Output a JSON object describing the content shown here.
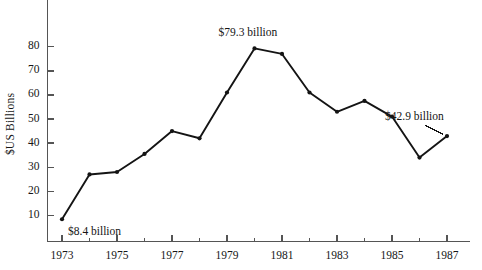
{
  "chart_data": {
    "type": "line",
    "title": "",
    "subtitle": "",
    "xlabel": "",
    "ylabel": "$US Billions",
    "xlim": [
      1972.6,
      1987.6
    ],
    "ylim": [
      0,
      86
    ],
    "grid": false,
    "legend": false,
    "legend_position": "none",
    "x": [
      1973,
      1974,
      1975,
      1976,
      1977,
      1978,
      1979,
      1980,
      1981,
      1982,
      1983,
      1984,
      1985,
      1986,
      1987
    ],
    "values": [
      8.4,
      27.0,
      28.0,
      35.5,
      45.0,
      42.0,
      61.0,
      79.3,
      77.0,
      61.0,
      53.0,
      57.5,
      51.0,
      34.0,
      42.9
    ],
    "series": [
      {
        "name": "",
        "values": [
          8.4,
          27.0,
          28.0,
          35.5,
          45.0,
          42.0,
          61.0,
          79.3,
          77.0,
          61.0,
          53.0,
          57.5,
          51.0,
          34.0,
          42.9
        ]
      }
    ],
    "y_ticks": [
      10,
      20,
      30,
      40,
      50,
      60,
      70,
      80
    ],
    "y_tick_labels": [
      "10",
      "20",
      "30",
      "40",
      "50",
      "60",
      "70",
      "80"
    ],
    "x_ticks": [
      1973,
      1974,
      1975,
      1976,
      1977,
      1978,
      1979,
      1980,
      1981,
      1982,
      1983,
      1984,
      1985,
      1986,
      1987
    ],
    "x_tick_labels": [
      "1973",
      "",
      "1975",
      "",
      "1977",
      "",
      "1979",
      "",
      "1981",
      "",
      "1983",
      "",
      "1985",
      "",
      "1987"
    ],
    "x_major_labels": [
      "1973",
      "1975",
      "1977",
      "1979",
      "1981",
      "1983",
      "1985",
      "1987"
    ],
    "annotations": [
      {
        "name": "first-point-label",
        "text": "$8.4 billion",
        "x": 1973,
        "y": 8.4
      },
      {
        "name": "peak-point-label",
        "text": "$79.3 billion",
        "x": 1980,
        "y": 79.3
      },
      {
        "name": "last-point-label",
        "text": "$42.9 billion",
        "x": 1987,
        "y": 42.9
      }
    ],
    "colors": {
      "line": "#141414",
      "marker": "#141414",
      "axis": "#555555",
      "text": "#161616",
      "background": "#ffffff"
    }
  }
}
